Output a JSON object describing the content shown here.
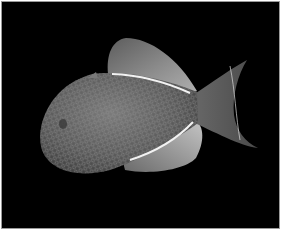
{
  "image": {
    "subject": "fish",
    "description": "Dark triggerfish with scaled body, white-lined dorsal and anal fins, and lunate tail on black background",
    "colors": {
      "background": "#000000",
      "border": "#ffffff",
      "body": "#6e6e6e",
      "fin": "#8a8a8a",
      "stripe": "#f2f2f2"
    }
  }
}
